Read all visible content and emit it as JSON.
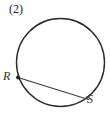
{
  "figure": {
    "item_number": "(2)",
    "background_color": "#ffffff",
    "stroke_color": "#2b2b2b",
    "canvas": {
      "width": 110,
      "height": 113
    },
    "circle": {
      "name": "circle",
      "center_x": 60.5,
      "center_y": 62.5,
      "radius": 44,
      "stroke_width": 1.4,
      "fill": "none"
    },
    "chord": {
      "name": "chord-RS",
      "from": "R",
      "to": "S",
      "x1": 18,
      "y1": 77.5,
      "x2": 88.5,
      "y2": 99.5,
      "stroke_width": 1.1
    },
    "points": [
      {
        "id": "R",
        "label": "R",
        "x": 18,
        "y": 77.5,
        "marker": "dot",
        "marker_radius": 1.9,
        "label_x": 3,
        "label_y": 70
      },
      {
        "id": "S",
        "label": "S",
        "x": 88.5,
        "y": 99.5,
        "marker": "tick",
        "marker_radius": 1.1,
        "label_x": 87,
        "label_y": 93
      }
    ]
  }
}
